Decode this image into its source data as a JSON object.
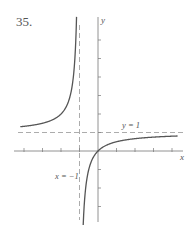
{
  "problem_number": "35.",
  "chart_data": {
    "type": "line",
    "title": "",
    "function": "y = x/(x+1)",
    "xlabel": "x",
    "ylabel": "y",
    "xlim": [
      -4.2,
      4.3
    ],
    "ylim": [
      -4,
      7.2
    ],
    "grid": false,
    "legend": null,
    "x_ticks": [
      -4,
      -3,
      -2,
      -1,
      1,
      2,
      3,
      4
    ],
    "y_ticks": [
      1,
      2,
      3,
      4,
      5,
      6,
      -1,
      -2,
      -3
    ],
    "asymptotes": [
      {
        "type": "vertical",
        "value": -1,
        "label": "x = −1"
      },
      {
        "type": "horizontal",
        "value": 1,
        "label": "y = 1"
      }
    ],
    "annotations": [
      "y = 1",
      "x = −1"
    ],
    "series": [
      {
        "name": "left branch",
        "x": [
          -4.2,
          -4,
          -3,
          -2,
          -1.5,
          -1.25,
          -1.16
        ],
        "y": [
          1.31,
          1.33,
          1.5,
          2,
          3,
          5,
          7.2
        ]
      },
      {
        "name": "right branch",
        "x": [
          -0.8,
          -0.75,
          -0.5,
          0,
          1,
          2,
          3,
          4,
          4.3
        ],
        "y": [
          -4,
          -3,
          -1,
          0,
          0.5,
          0.667,
          0.75,
          0.8,
          0.81
        ]
      }
    ]
  }
}
